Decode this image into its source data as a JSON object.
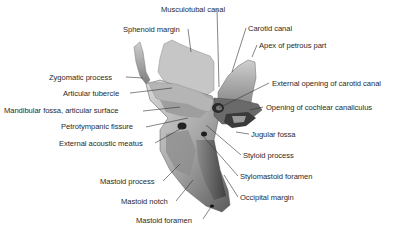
{
  "figure": {
    "background": "#ffffff",
    "label_color": "#2a2a2a",
    "leader_color": "#333333"
  },
  "labels": {
    "left": [
      {
        "id": "sphenoid-margin",
        "text": "Sphenoid margin"
      },
      {
        "id": "zygomatic-process",
        "text": "Zygomatic process"
      },
      {
        "id": "articular-tubercle",
        "text": "Articular tubercle"
      },
      {
        "id": "mandibular-fossa",
        "text": "Mandibular fossa, articular surface"
      },
      {
        "id": "petrotympanic-fissure",
        "text": "Petrotympanic fissure"
      },
      {
        "id": "external-acoustic-meatus",
        "text": "External acoustic meatus"
      },
      {
        "id": "mastoid-process",
        "text": "Mastoid process"
      },
      {
        "id": "mastoid-notch",
        "text": "Mastoid notch"
      },
      {
        "id": "mastoid-foramen",
        "text": "Mastoid foramen"
      }
    ],
    "top": [
      {
        "id": "musculotubal-canal",
        "text": "Musculotubal canal"
      }
    ],
    "right": [
      {
        "id": "carotid-canal",
        "text": "Carotid canal"
      },
      {
        "id": "apex-petrous",
        "text": "Apex of petrous part"
      },
      {
        "id": "ext-opening-carotid",
        "text": "External opening of carotid canal"
      },
      {
        "id": "cochlear-canaliculus",
        "text": "Opening of cochlear canaliculus"
      },
      {
        "id": "jugular-fossa",
        "text": "Jugular fossa"
      },
      {
        "id": "styloid-process",
        "text": "Styloid process"
      },
      {
        "id": "stylomastoid-foramen",
        "text": "Stylomastoid foramen"
      },
      {
        "id": "occipital-margin",
        "text": "Occipital margin"
      }
    ]
  }
}
